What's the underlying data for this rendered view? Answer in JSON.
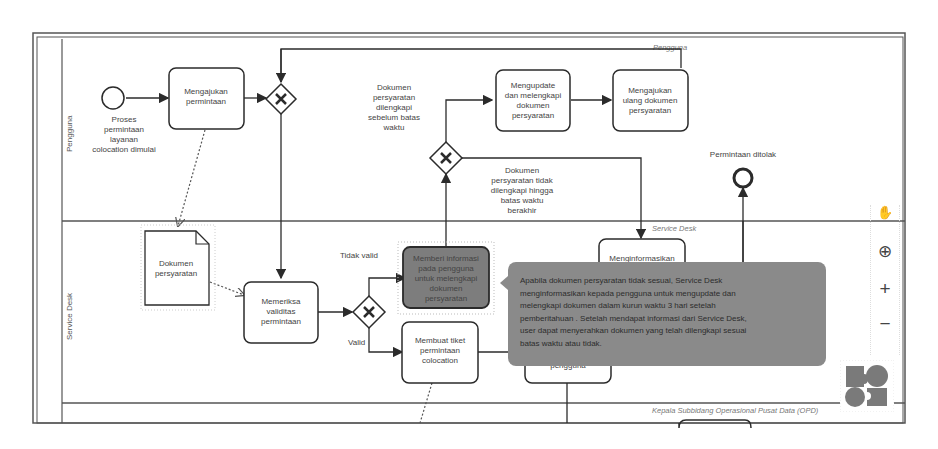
{
  "lanes": [
    {
      "id": "pengguna",
      "label": "Pengguna",
      "title": "Pengguna"
    },
    {
      "id": "service-desk",
      "label": "Service Desk",
      "title": "Service Desk"
    },
    {
      "id": "kasubbid",
      "title": "Kepala Subbidang Operasional Pusat Data (OPD)"
    }
  ],
  "start_event": {
    "label_lines": [
      "Proses",
      "permintaan",
      "layanan",
      "colocation dimulai"
    ]
  },
  "end_event": {
    "label": "Permintaan ditolak"
  },
  "tasks": {
    "mengajukan": {
      "lines": [
        "Mengajukan",
        "permintaan"
      ]
    },
    "mengupdate": {
      "lines": [
        "Mengupdate",
        "dan melengkapi",
        "dokumen",
        "persyaratan"
      ]
    },
    "mengajukan_ulang": {
      "lines": [
        "Mengajukan",
        "ulang dokumen",
        "persyaratan"
      ]
    },
    "memeriksa": {
      "lines": [
        "Memeriksa",
        "validitas",
        "permintaan"
      ]
    },
    "memberi_info": {
      "lines": [
        "Memberi informasi",
        "pada pengguna",
        "untuk melengkapi",
        "dokumen",
        "persyaratan"
      ]
    },
    "membuat_tiket": {
      "lines": [
        "Membuat tiket",
        "permintaan",
        "colocation"
      ]
    },
    "menginformasikan": {
      "lines": [
        "Menginformasikan"
      ]
    },
    "menginformasikan_bottom": {
      "lines": [
        "pengguna"
      ]
    }
  },
  "data_object": {
    "lines": [
      "Dokumen",
      "persyaratan"
    ]
  },
  "flow_labels": {
    "dilengkapi": [
      "Dokumen",
      "persyaratan",
      "dilengkapi",
      "sebelum batas",
      "waktu"
    ],
    "tidak_dilengkapi": [
      "Dokumen",
      "persyaratan tidak",
      "dilengkapi hingga",
      "batas waktu",
      "berakhir"
    ],
    "tidak_valid": "Tidak valid",
    "valid": "Valid"
  },
  "tooltip": {
    "lines": [
      "Apabila dokumen persyaratan tidak sesuai, Service Desk",
      "menginformasikan kepada pengguna untuk mengupdate dan",
      "melengkapi dokumen dalam kurun waktu 3 hari setelah",
      "pemberitahuan . Setelah mendapat informasi dari Service Desk,",
      "user dapat menyerahkan dokumen yang telah dilengkapi sesuai",
      "batas waktu atau tidak."
    ]
  },
  "controls": {
    "hand_icon": "✋",
    "center_icon": "⊕",
    "zoom_in": "+",
    "zoom_out": "−"
  },
  "colors": {
    "stroke": "#2b2b2b",
    "selected_task": "#7d7d7d",
    "tooltip_bg": "#8a8a8a",
    "minimap": "#7a7a7a"
  }
}
